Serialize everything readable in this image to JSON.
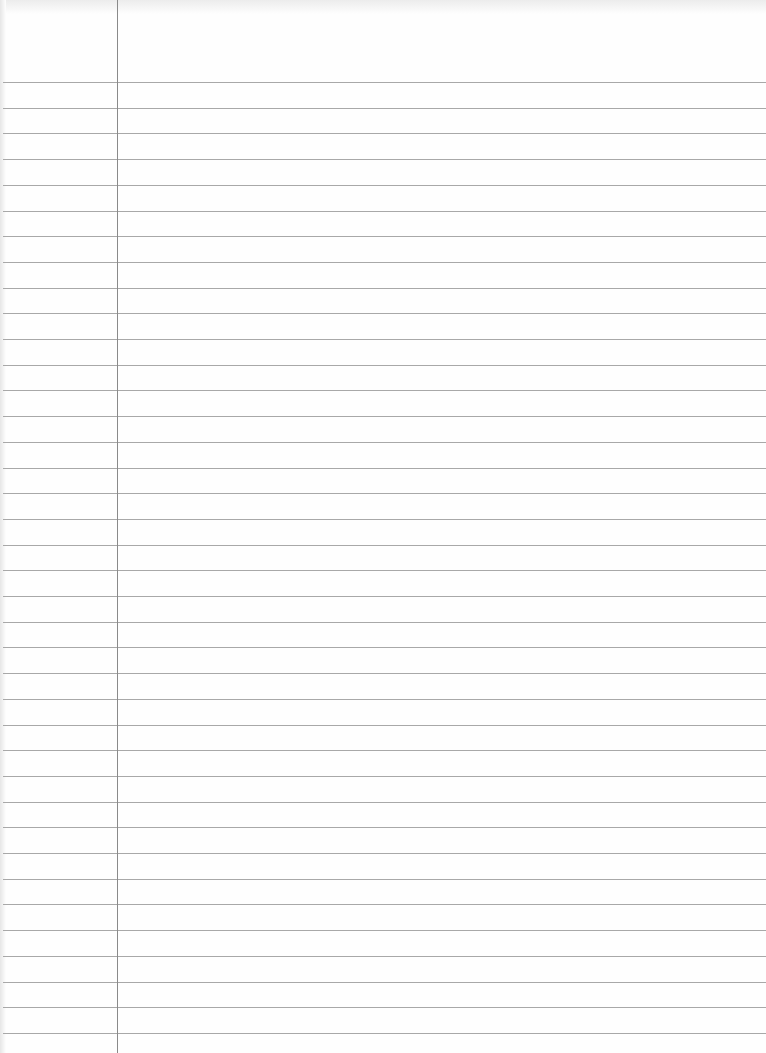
{
  "paper": {
    "type": "lined-notebook-paper",
    "line_count": 38,
    "first_line_y": 82,
    "line_spacing": 25.7,
    "margin_x": 117,
    "colors": {
      "paper": "#fefefe",
      "rule": "#a8a8a8",
      "margin": "#8a8a8a"
    }
  }
}
